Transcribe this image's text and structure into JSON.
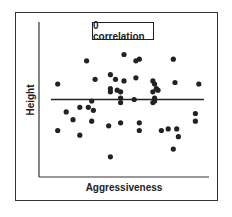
{
  "chart_data": {
    "type": "scatter",
    "title": "0 correlation",
    "xlabel": "Aggressiveness",
    "ylabel": "Height",
    "grid": false,
    "legend": null,
    "xlim": [
      0,
      100
    ],
    "ylim": [
      0,
      100
    ],
    "note": "Points in plot-pixel-derived relative units (0-100); horizontal trend line indicates zero correlation.",
    "trend_line": {
      "x": [
        7,
        97
      ],
      "y": [
        50,
        50
      ],
      "slope": 0
    },
    "points": [
      {
        "x": 11,
        "y": 60
      },
      {
        "x": 11,
        "y": 30
      },
      {
        "x": 16,
        "y": 42
      },
      {
        "x": 20,
        "y": 37
      },
      {
        "x": 24,
        "y": 45
      },
      {
        "x": 24,
        "y": 27
      },
      {
        "x": 28,
        "y": 75
      },
      {
        "x": 29,
        "y": 45
      },
      {
        "x": 31,
        "y": 36
      },
      {
        "x": 31,
        "y": 49
      },
      {
        "x": 32,
        "y": 43
      },
      {
        "x": 33,
        "y": 63
      },
      {
        "x": 41,
        "y": 33
      },
      {
        "x": 42,
        "y": 66
      },
      {
        "x": 42,
        "y": 55
      },
      {
        "x": 42,
        "y": 57
      },
      {
        "x": 42,
        "y": 13
      },
      {
        "x": 45,
        "y": 63
      },
      {
        "x": 46,
        "y": 56
      },
      {
        "x": 48,
        "y": 55
      },
      {
        "x": 48,
        "y": 51
      },
      {
        "x": 48,
        "y": 48
      },
      {
        "x": 48,
        "y": 35
      },
      {
        "x": 50,
        "y": 79
      },
      {
        "x": 50,
        "y": 62
      },
      {
        "x": 56,
        "y": 50
      },
      {
        "x": 57,
        "y": 64
      },
      {
        "x": 57,
        "y": 75
      },
      {
        "x": 59,
        "y": 76
      },
      {
        "x": 59,
        "y": 35
      },
      {
        "x": 59,
        "y": 30
      },
      {
        "x": 67,
        "y": 62
      },
      {
        "x": 68,
        "y": 60
      },
      {
        "x": 67,
        "y": 55
      },
      {
        "x": 69,
        "y": 57
      },
      {
        "x": 67,
        "y": 48
      },
      {
        "x": 68,
        "y": 49
      },
      {
        "x": 68,
        "y": 51
      },
      {
        "x": 70,
        "y": 56
      },
      {
        "x": 72,
        "y": 30
      },
      {
        "x": 76,
        "y": 31
      },
      {
        "x": 79,
        "y": 76
      },
      {
        "x": 80,
        "y": 61
      },
      {
        "x": 81,
        "y": 31
      },
      {
        "x": 82,
        "y": 26
      },
      {
        "x": 79,
        "y": 18
      },
      {
        "x": 92,
        "y": 41
      },
      {
        "x": 92,
        "y": 36
      },
      {
        "x": 94,
        "y": 60
      }
    ]
  },
  "plot": {
    "origin_px": [
      39,
      177
    ],
    "x_end_px": 209,
    "y_top_px": 22,
    "colors": {
      "points": "#222222",
      "axes": "#333333",
      "frame": "#333333"
    }
  }
}
